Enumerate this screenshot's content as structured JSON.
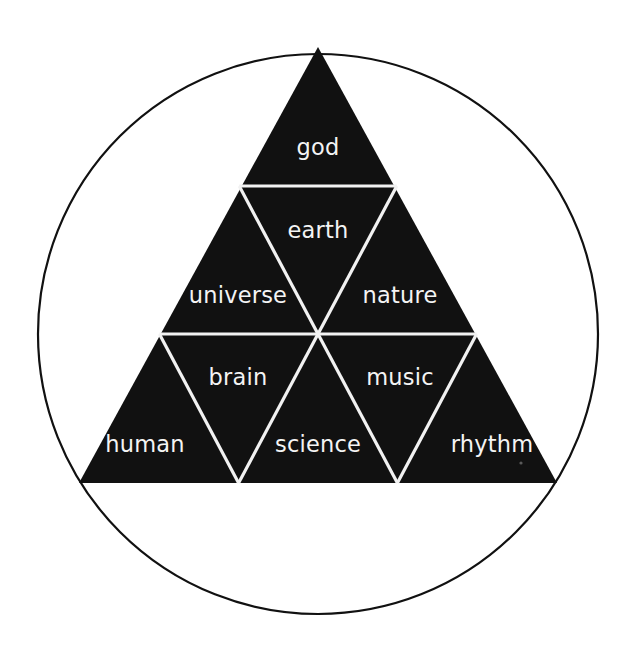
{
  "figure": {
    "title": "",
    "shape": "triangle-inscribed-in-circle",
    "background_color": "#ffffff",
    "triangle_fill_color": "#111111",
    "divider_color": "#f2f2f2",
    "circle_stroke_color": "#111111",
    "label_color": "#f4f4f4"
  },
  "geometry": {
    "circle": {
      "cx": 318,
      "cy": 334,
      "r": 280
    },
    "triangle": {
      "apex": {
        "x": 318,
        "y": 47
      },
      "bottom_left": {
        "x": 79,
        "y": 483
      },
      "bottom_right": {
        "x": 557,
        "y": 483
      }
    },
    "row_divider_y": [
      186,
      334
    ]
  },
  "cells": {
    "row1": [
      {
        "id": "god",
        "label": "god",
        "orientation": "up",
        "cx": 318,
        "cy": 155
      }
    ],
    "row2": [
      {
        "id": "universe",
        "label": "universe",
        "orientation": "up",
        "cx": 238,
        "cy": 303
      },
      {
        "id": "earth",
        "label": "earth",
        "orientation": "down",
        "cx": 318,
        "cy": 238
      },
      {
        "id": "nature",
        "label": "nature",
        "orientation": "up",
        "cx": 399,
        "cy": 303
      }
    ],
    "row3": [
      {
        "id": "human",
        "label": "human",
        "orientation": "up",
        "cx": 144,
        "cy": 452
      },
      {
        "id": "brain",
        "label": "brain",
        "orientation": "down",
        "cx": 238,
        "cy": 385
      },
      {
        "id": "science",
        "label": "science",
        "orientation": "up",
        "cx": 318,
        "cy": 452
      },
      {
        "id": "music",
        "label": "music",
        "orientation": "down",
        "cx": 399,
        "cy": 385
      },
      {
        "id": "rhythm",
        "label": "rhythm",
        "orientation": "up",
        "cx": 491,
        "cy": 452
      }
    ]
  },
  "all_labels": [
    "god",
    "earth",
    "universe",
    "nature",
    "brain",
    "music",
    "human",
    "science",
    "rhythm"
  ]
}
